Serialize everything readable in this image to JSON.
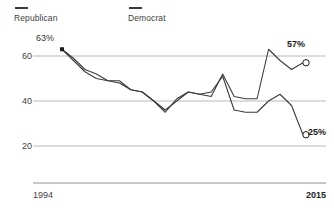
{
  "legend": {
    "items": [
      {
        "label": "Republican",
        "color": "#3b3b3b",
        "icon": "line-swatch-icon"
      },
      {
        "label": "Democrat",
        "color": "#3b3b3b",
        "icon": "line-swatch-icon"
      }
    ]
  },
  "axis": {
    "y_ticks": [
      "60",
      "40",
      "20"
    ],
    "x_start": "1994",
    "x_end": "2015"
  },
  "callouts": {
    "start_value": "63%",
    "republican_end": "57%",
    "democrat_end": "25%"
  },
  "chart_data": {
    "type": "line",
    "title": "",
    "subtitle": "",
    "xlabel": "",
    "ylabel": "",
    "xlim": [
      1994,
      2015
    ],
    "ylim": [
      14,
      68
    ],
    "grid": true,
    "gridlines": [
      60,
      40,
      20
    ],
    "legend_position": "top-left",
    "annotations": [
      {
        "text": "63%",
        "series": "Republican",
        "x": 1994,
        "y": 63,
        "marker": "filled-square"
      },
      {
        "text": "57%",
        "series": "Republican",
        "x": 2015,
        "y": 57,
        "marker": "open-circle"
      },
      {
        "text": "25%",
        "series": "Democrat",
        "x": 2015,
        "y": 25,
        "marker": "open-circle"
      }
    ],
    "x": [
      1994,
      1995,
      1996,
      1997,
      1998,
      1999,
      2000,
      2001,
      2002,
      2003,
      2004,
      2005,
      2006,
      2007,
      2008,
      2009,
      2010,
      2011,
      2012,
      2013,
      2014,
      2015
    ],
    "series": [
      {
        "name": "Republican",
        "color": "#3b3b3b",
        "values": [
          63,
          59,
          54,
          52,
          49,
          48,
          45,
          44,
          40,
          36,
          40,
          44,
          43,
          42,
          52,
          42,
          41,
          41,
          63,
          58,
          54,
          57
        ]
      },
      {
        "name": "Democrat",
        "color": "#3b3b3b",
        "values": [
          63,
          58,
          53,
          50,
          49,
          49,
          45,
          44,
          40,
          35,
          41,
          44,
          43,
          44,
          51,
          36,
          35,
          35,
          40,
          43,
          38,
          25
        ]
      }
    ]
  }
}
